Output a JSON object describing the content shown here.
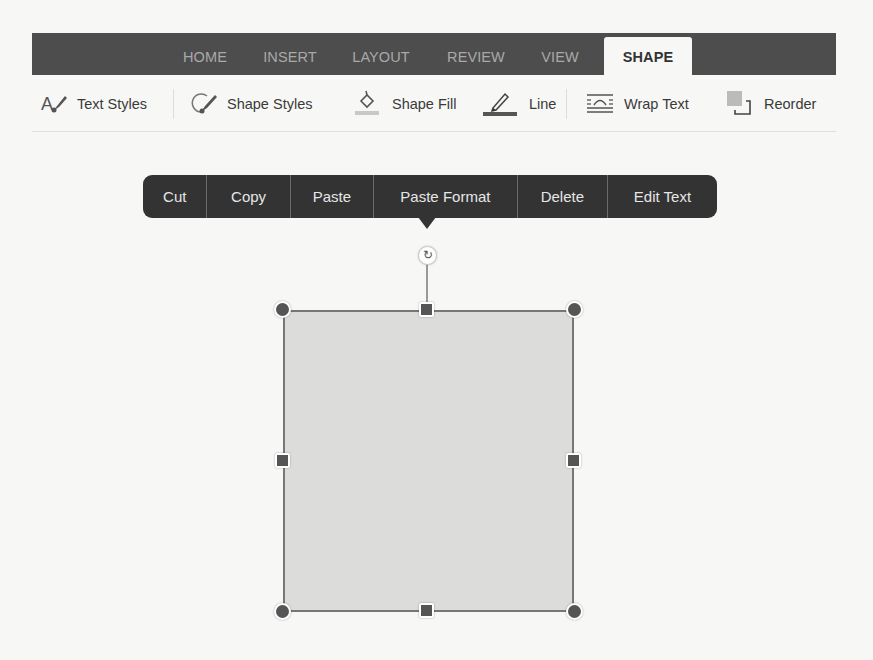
{
  "ribbon": {
    "tabs": [
      {
        "label": "HOME",
        "active": false
      },
      {
        "label": "INSERT",
        "active": false
      },
      {
        "label": "LAYOUT",
        "active": false
      },
      {
        "label": "REVIEW",
        "active": false
      },
      {
        "label": "VIEW",
        "active": false
      },
      {
        "label": "SHAPE",
        "active": true
      }
    ]
  },
  "toolbar": {
    "text_styles": {
      "label": "Text Styles",
      "icon": "text-brush-icon"
    },
    "shape_styles": {
      "label": "Shape Styles",
      "icon": "shape-brush-icon"
    },
    "shape_fill": {
      "label": "Shape Fill",
      "icon": "paint-bucket-icon",
      "swatch_color": "#c8c8c8"
    },
    "line": {
      "label": "Line",
      "icon": "pen-icon",
      "swatch_color": "#555555"
    },
    "wrap_text": {
      "label": "Wrap Text",
      "icon": "wrap-text-icon"
    },
    "reorder": {
      "label": "Reorder",
      "icon": "reorder-icon"
    }
  },
  "context_menu": {
    "items": [
      "Cut",
      "Copy",
      "Paste",
      "Paste Format",
      "Delete",
      "Edit Text"
    ]
  },
  "shape": {
    "type": "rectangle",
    "fill": "#dcdcdb",
    "stroke": "#777777",
    "rotate_glyph": "↻"
  },
  "colors": {
    "tabbar_bg": "#4d4d4d",
    "menu_bg": "#333333",
    "page_bg": "#f7f7f5"
  }
}
